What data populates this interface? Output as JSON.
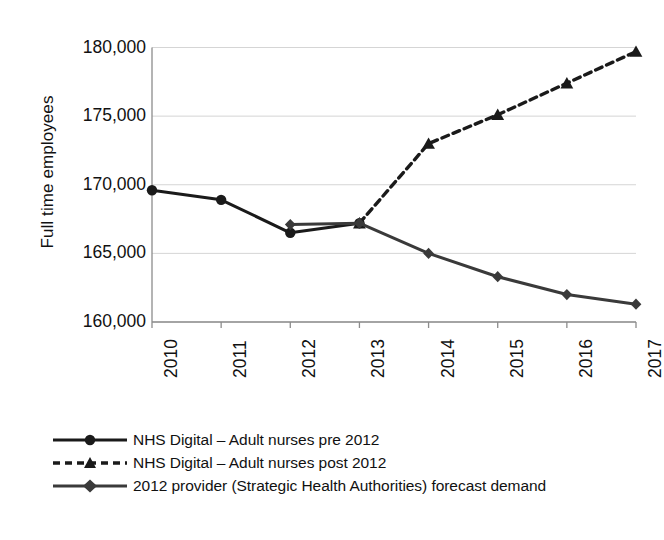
{
  "chart_data": {
    "type": "line",
    "title": "",
    "xlabel": "",
    "ylabel": "Full time employees",
    "x": [
      2010,
      2011,
      2012,
      2013,
      2014,
      2015,
      2016,
      2017
    ],
    "categories": [
      "2010",
      "2011",
      "2012",
      "2013",
      "2014",
      "2015",
      "2016",
      "2017"
    ],
    "ylim": [
      160000,
      180000
    ],
    "yticks": [
      160000,
      165000,
      170000,
      175000,
      180000
    ],
    "ytick_labels": [
      "160,000",
      "165,000",
      "170,000",
      "175,000",
      "180,000"
    ],
    "grid": true,
    "grid_axis": "y",
    "legend_position": "bottom-left",
    "series": [
      {
        "name": "NHS Digital – Adult nurses pre 2012",
        "marker": "circle",
        "linestyle": "solid",
        "color": "#1a1a1a",
        "x": [
          2010,
          2011,
          2012,
          2013
        ],
        "values": [
          169600,
          168900,
          166500,
          167200
        ]
      },
      {
        "name": "NHS Digital – Adult nurses post 2012",
        "marker": "triangle",
        "linestyle": "dashed",
        "color": "#1a1a1a",
        "x": [
          2013,
          2014,
          2015,
          2016,
          2017
        ],
        "values": [
          167200,
          173000,
          175100,
          177400,
          179700
        ]
      },
      {
        "name": "2012 provider (Strategic Health Authorities) forecast demand",
        "marker": "diamond",
        "linestyle": "solid",
        "color": "#3a3a3a",
        "x": [
          2012,
          2013,
          2014,
          2015,
          2016,
          2017
        ],
        "values": [
          167100,
          167200,
          165000,
          163300,
          162000,
          161300
        ]
      }
    ]
  },
  "legend": {
    "items": [
      {
        "label": "NHS Digital – Adult nurses pre 2012",
        "marker": "circle-marker",
        "linestyle": "solid"
      },
      {
        "label": "NHS Digital – Adult nurses post 2012",
        "marker": "triangle-marker",
        "linestyle": "dashed"
      },
      {
        "label": "2012 provider (Strategic Health Authorities) forecast demand",
        "marker": "diamond-marker",
        "linestyle": "solid"
      }
    ]
  },
  "colors": {
    "background": "#ffffff",
    "axis": "#8c8c8c",
    "grid": "#d5d5d5",
    "series_primary": "#1a1a1a",
    "series_secondary": "#3a3a3a",
    "text": "#111111"
  }
}
